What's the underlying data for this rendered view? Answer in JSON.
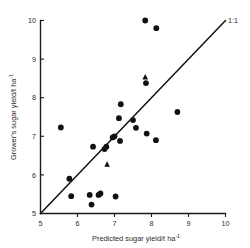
{
  "chart_data": {
    "type": "scatter",
    "title": "",
    "xlabel": "Predicted sugar yield/t ha",
    "xlabel_sup": "-1",
    "ylabel": "Grower's sugar yield/t ha",
    "ylabel_sup": "-1",
    "xlim": [
      5,
      10
    ],
    "ylim": [
      5,
      10
    ],
    "xticks": [
      5,
      6,
      7,
      8,
      9,
      10
    ],
    "yticks": [
      5,
      6,
      7,
      8,
      9,
      10
    ],
    "xtick_labels": [
      "5",
      "6",
      "7",
      "8",
      "9",
      "10"
    ],
    "ytick_labels": [
      "5",
      "6",
      "7",
      "8",
      "9",
      "10"
    ],
    "grid": false,
    "legend_position": "none",
    "reference_line": {
      "label": "1:1",
      "from": [
        5,
        5
      ],
      "to": [
        10,
        10
      ],
      "color": "#111111"
    },
    "series": [
      {
        "name": "circle-markers",
        "marker": "circle",
        "color": "#111111",
        "points": [
          [
            7.83,
            10.0
          ],
          [
            8.13,
            9.8
          ],
          [
            7.85,
            8.38
          ],
          [
            7.17,
            7.83
          ],
          [
            8.7,
            7.63
          ],
          [
            7.12,
            7.47
          ],
          [
            7.5,
            7.42
          ],
          [
            5.55,
            7.23
          ],
          [
            7.58,
            7.22
          ],
          [
            7.87,
            7.07
          ],
          [
            7.0,
            7.0
          ],
          [
            6.95,
            6.97
          ],
          [
            7.15,
            6.88
          ],
          [
            8.12,
            6.9
          ],
          [
            6.78,
            6.73
          ],
          [
            6.42,
            6.73
          ],
          [
            6.73,
            6.67
          ],
          [
            5.78,
            5.9
          ],
          [
            6.33,
            5.48
          ],
          [
            6.62,
            5.52
          ],
          [
            6.57,
            5.48
          ],
          [
            5.83,
            5.45
          ],
          [
            7.03,
            5.44
          ],
          [
            6.38,
            5.23
          ]
        ]
      },
      {
        "name": "triangle-markers",
        "marker": "triangle",
        "color": "#111111",
        "points": [
          [
            7.83,
            8.53
          ],
          [
            6.8,
            6.27
          ]
        ]
      }
    ]
  },
  "figure": {
    "background_color": "#ffffff",
    "axis_color": "#1a1a1a",
    "marker_color": "#111111"
  }
}
